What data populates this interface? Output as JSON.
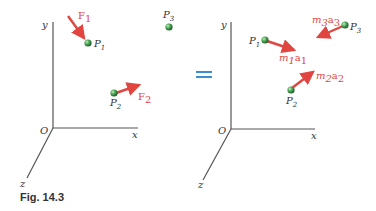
{
  "figure": {
    "caption": "Fig. 14.3",
    "equals_sign": "=",
    "colors": {
      "axis": "#555555",
      "vector": "#e0463f",
      "particle": "#3f9a4a",
      "equals": "#3a8fd0",
      "label": "#333333"
    }
  },
  "left_diagram": {
    "axes": {
      "origin": "O",
      "x": "x",
      "y": "y",
      "z": "z"
    },
    "particles": [
      {
        "name": "P",
        "sub": "1"
      },
      {
        "name": "P",
        "sub": "2"
      },
      {
        "name": "P",
        "sub": "3"
      }
    ],
    "forces": [
      {
        "name": "F",
        "sub": "1",
        "acts_on": "P1"
      },
      {
        "name": "F",
        "sub": "2",
        "acts_on": "P2"
      }
    ]
  },
  "right_diagram": {
    "axes": {
      "origin": "O",
      "x": "x",
      "y": "y",
      "z": "z"
    },
    "particles": [
      {
        "name": "P",
        "sub": "1"
      },
      {
        "name": "P",
        "sub": "2"
      },
      {
        "name": "P",
        "sub": "3"
      }
    ],
    "effective_forces": [
      {
        "m": "m",
        "m_sub": "1",
        "a": "a",
        "a_sub": "1",
        "acts_on": "P1"
      },
      {
        "m": "m",
        "m_sub": "2",
        "a": "a",
        "a_sub": "2",
        "acts_on": "P2"
      },
      {
        "m": "m",
        "m_sub": "3",
        "a": "a",
        "a_sub": "3",
        "acts_on": "P3"
      }
    ]
  }
}
